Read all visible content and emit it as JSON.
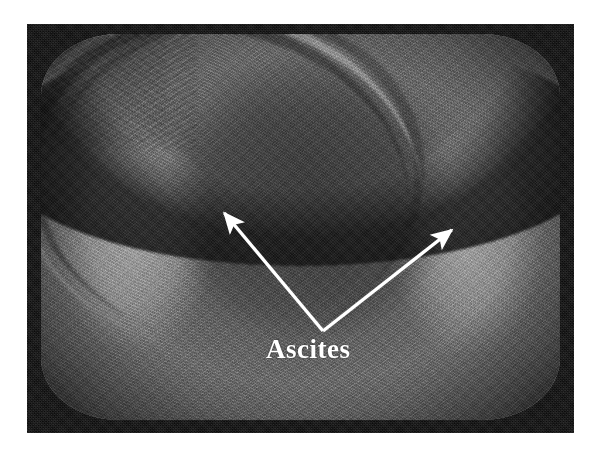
{
  "image": {
    "modality": "ultrasound",
    "display": "CRT monitor photograph",
    "width_px": 601,
    "height_px": 458
  },
  "photo": {
    "left_px": 27,
    "top_px": 24,
    "width_px": 547,
    "height_px": 409,
    "border_color": "#0c0c0c",
    "background_color": "#ffffff"
  },
  "scan": {
    "base_tissue_color": "#565656",
    "fluid_color": "#b0b0b0",
    "mass_color": "#3a3a3a",
    "bezel_color": "#0c0c0c"
  },
  "annotations": {
    "label": {
      "text": "Ascites",
      "color": "#ffffff",
      "x_px": 266,
      "y_px": 334,
      "font_size_px": 27
    },
    "arrows": [
      {
        "name": "arrow-left",
        "from_x": 323,
        "from_y": 331,
        "to_x": 216,
        "to_y": 203,
        "color": "#ffffff",
        "points_to": "left flank ascitic fluid"
      },
      {
        "name": "arrow-right",
        "from_x": 323,
        "from_y": 331,
        "to_x": 462,
        "to_y": 222,
        "color": "#ffffff",
        "points_to": "right flank ascitic fluid"
      }
    ]
  }
}
